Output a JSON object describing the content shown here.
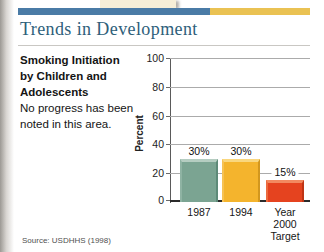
{
  "header": {
    "accent_blue": "#4a7ba6",
    "accent_gold": "#eac253",
    "title": "Trends in Development",
    "title_color": "#2e607a"
  },
  "panel_text": {
    "heading_lines": [
      "Smoking Initiation",
      "by Children and",
      "Adolescents"
    ],
    "body_lines": [
      "No progress has been",
      "noted in this area."
    ]
  },
  "chart_data": {
    "type": "bar",
    "title": "Smoking Initiation by Children and Adolescents",
    "categories": [
      "1987",
      "1994",
      "Year 2000 Target"
    ],
    "category_lines": [
      [
        "1987"
      ],
      [
        "1994"
      ],
      [
        "Year",
        "2000",
        "Target"
      ]
    ],
    "values": [
      30,
      30,
      15
    ],
    "value_labels": [
      "30%",
      "30%",
      "15%"
    ],
    "xlabel": "",
    "ylabel": "Percent",
    "ylim": [
      0,
      100
    ],
    "yticks": [
      0,
      20,
      40,
      60,
      80,
      100
    ],
    "grid": true,
    "legend": "none",
    "bar_styles": [
      {
        "fill": "#7ba492",
        "light": "#b5cdc1",
        "edge": "#8fb3a3",
        "dark": "#5d8a78"
      },
      {
        "fill": "#f4b42d",
        "light": "#f9d77f",
        "edge": "#f6c254",
        "dark": "#d2971e"
      },
      {
        "fill": "#e5431f",
        "light": "#f28a60",
        "edge": "#ec6a3e",
        "dark": "#bf3414"
      }
    ]
  },
  "source": "Source: USDHHS (1998)"
}
